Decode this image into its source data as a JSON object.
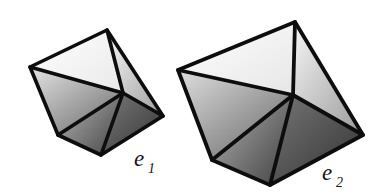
{
  "figure": {
    "background_color": "#ffffff",
    "edge_color": "#0d0d0d",
    "shape_count": 2,
    "shapes": [
      {
        "id": "polyhedron-e1",
        "label": "e",
        "subscript": "1",
        "label_full": "e1",
        "label_x": 134,
        "label_y": 166,
        "solid_type": "octahedron",
        "visible_faces": 6,
        "vertices": {
          "left": [
            30,
            67
          ],
          "top": [
            107,
            30
          ],
          "right": [
            163,
            116
          ],
          "bottom": [
            101,
            155
          ],
          "lower_left": [
            58,
            135
          ],
          "center": [
            123,
            93
          ]
        },
        "face_colors": {
          "upper_light": "#fdfdfd",
          "upper_mid": "#e6e6e6",
          "left_mid": "#c4c4c4",
          "lower_mid": "#8a8a8a",
          "right_dark": "#4a4a4a",
          "darkest": "#343434"
        }
      },
      {
        "id": "polyhedron-e2",
        "label": "e",
        "subscript": "2",
        "label_full": "e2",
        "label_x": 322,
        "label_y": 180,
        "solid_type": "octahedron",
        "visible_faces": 6,
        "vertices": {
          "left": [
            178,
            70
          ],
          "top": [
            295,
            22
          ],
          "right": [
            363,
            135
          ],
          "bottom": [
            270,
            185
          ],
          "lower_left": [
            212,
            160
          ],
          "center": [
            293,
            95
          ]
        },
        "face_colors": {
          "upper_light": "#fdfdfd",
          "upper_mid": "#e2e2e2",
          "left_mid": "#bfbfbf",
          "lower_mid": "#858585",
          "right_dark": "#484848",
          "darkest": "#323232"
        }
      }
    ]
  }
}
